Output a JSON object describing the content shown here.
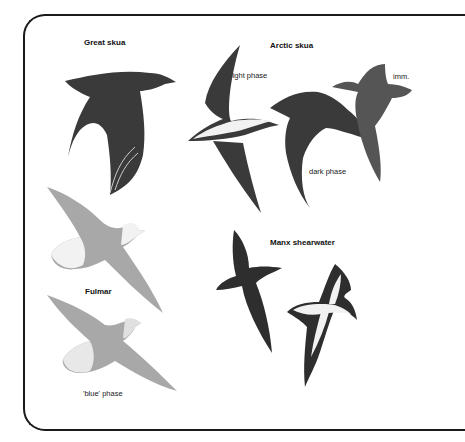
{
  "plate": {
    "species": [
      {
        "name": "Great skua",
        "figures": [
          {
            "caption": "",
            "tone": "dark"
          }
        ]
      },
      {
        "name": "Arctic skua",
        "figures": [
          {
            "caption": "light phase",
            "tone": "light-belly"
          },
          {
            "caption": "dark phase",
            "tone": "dark"
          },
          {
            "caption": "imm.",
            "tone": "barred"
          }
        ]
      },
      {
        "name": "Fulmar",
        "figures": [
          {
            "caption": "",
            "tone": "grey-white-head"
          },
          {
            "caption": "'blue' phase",
            "tone": "grey"
          }
        ]
      },
      {
        "name": "Manx shearwater",
        "figures": [
          {
            "caption": "",
            "tone": "upperside-dark"
          },
          {
            "caption": "",
            "tone": "underside-white"
          }
        ]
      }
    ]
  },
  "colors": {
    "ink": "#1a1a1a",
    "dark_bird": "#3a3a3a",
    "grey_bird": "#a8a8a8",
    "white_part": "#f2f2f2"
  }
}
